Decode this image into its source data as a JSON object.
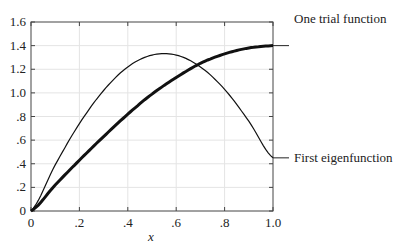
{
  "chart_data": {
    "type": "line",
    "title": "",
    "xlabel": "x",
    "ylabel": "",
    "xlim": [
      0,
      1.0
    ],
    "ylim": [
      0,
      1.6
    ],
    "x_ticks": [
      "0",
      ".2",
      ".4",
      ".6",
      ".8",
      "1.0"
    ],
    "y_ticks": [
      "0",
      ".2",
      ".4",
      ".6",
      ".8",
      "1.0",
      "1.2",
      "1.4",
      "1.6"
    ],
    "grid": true,
    "x": [
      0,
      0.1,
      0.2,
      0.3,
      0.4,
      0.5,
      0.6,
      0.7,
      0.8,
      0.9,
      1.0
    ],
    "series": [
      {
        "name": "One trial function",
        "values": [
          0,
          0.22,
          0.43,
          0.63,
          0.82,
          0.99,
          1.13,
          1.25,
          1.33,
          1.38,
          1.4
        ],
        "style": "thick"
      },
      {
        "name": "First eigenfunction",
        "values": [
          0,
          0.39,
          0.74,
          1.02,
          1.22,
          1.32,
          1.32,
          1.22,
          1.03,
          0.76,
          0.45
        ],
        "style": "thin"
      }
    ],
    "annotations": [
      "One trial function",
      "First eigenfunction"
    ]
  }
}
